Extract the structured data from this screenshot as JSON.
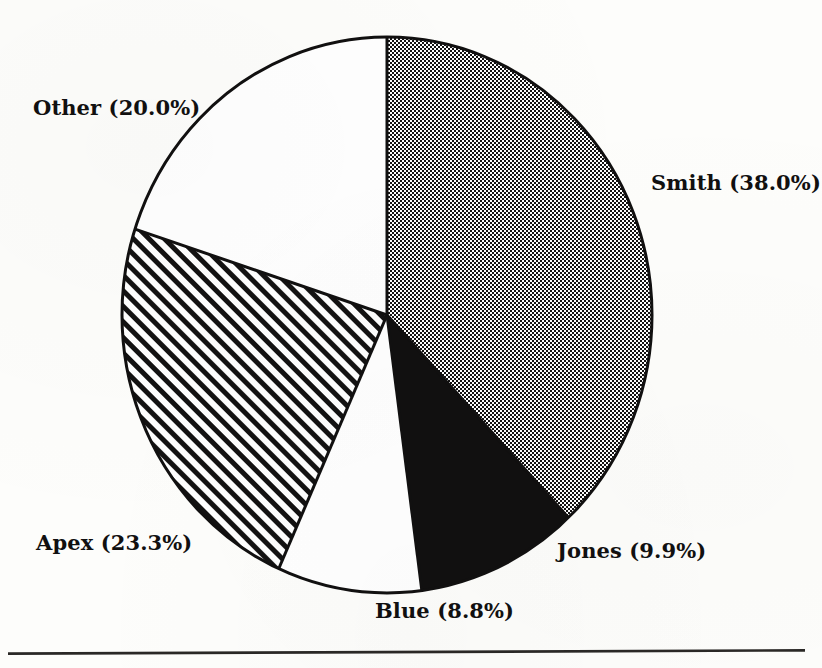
{
  "document": {
    "kind": "scanned-figure",
    "background_color": "#fdfdfb",
    "ink_color": "#111010"
  },
  "chart_data": {
    "type": "pie",
    "title": "",
    "xlabel": "",
    "ylabel": "",
    "legend_position": "none",
    "labels_position": "outside-callout",
    "start_angle_deg": 90,
    "direction": "clockwise",
    "categories": [
      "Smith",
      "Jones",
      "Blue",
      "Apex",
      "Other"
    ],
    "values": [
      38.0,
      9.9,
      8.8,
      23.3,
      20.0
    ],
    "units": "percent",
    "slices": [
      {
        "name": "Smith",
        "value": 38.0,
        "label": "Smith (38.0%)",
        "fill": "dotted",
        "fill_color": "#9a9a9a",
        "start_deg": 0.0,
        "end_deg": 136.8,
        "label_x": 651,
        "label_y": 170
      },
      {
        "name": "Jones",
        "value": 9.9,
        "label": "Jones (9.9%)",
        "fill": "solid-black",
        "fill_color": "#111010",
        "start_deg": 136.8,
        "end_deg": 172.44,
        "label_x": 557,
        "label_y": 538
      },
      {
        "name": "Blue",
        "value": 8.8,
        "label": "Blue (8.8%)",
        "fill": "white",
        "fill_color": "#ffffff",
        "start_deg": 172.44,
        "end_deg": 204.12,
        "label_x": 375,
        "label_y": 598
      },
      {
        "name": "Apex",
        "value": 23.3,
        "label": "Apex (23.3%)",
        "fill": "diagonal-hatch",
        "fill_color": "#ffffff",
        "start_deg": 204.12,
        "end_deg": 288.0,
        "label_x": 36,
        "label_y": 530
      },
      {
        "name": "Other",
        "value": 20.0,
        "label": "Other (20.0%)",
        "fill": "white",
        "fill_color": "#ffffff",
        "start_deg": 288.0,
        "end_deg": 360.0,
        "label_x": 33,
        "label_y": 95
      }
    ],
    "geometry": {
      "center_x": 387,
      "center_y": 315,
      "radius_x": 265,
      "radius_y": 278,
      "outline_color": "#111010",
      "outline_width": 3
    }
  },
  "footer": {
    "rule_label": "horizontal-rule",
    "color": "#2a2826"
  }
}
